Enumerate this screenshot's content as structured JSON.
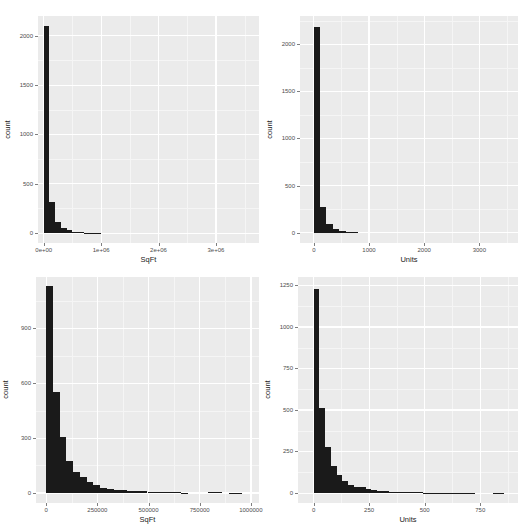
{
  "chart_data": [
    {
      "type": "bar",
      "title": "",
      "xlabel": "SqFt",
      "ylabel": "count",
      "x_ticks": [
        "0e+00",
        "1e+06",
        "2e+06",
        "3e+06"
      ],
      "x_tick_values": [
        0,
        1000000,
        2000000,
        3000000
      ],
      "y_ticks": [
        "0",
        "500",
        "1000",
        "1500",
        "2000"
      ],
      "y_tick_values": [
        0,
        500,
        1000,
        1500,
        2000
      ],
      "xlim": [
        -100000,
        3750000
      ],
      "ylim": [
        -100,
        2200
      ],
      "bin_width": 100000,
      "bin_starts": [
        0,
        100000,
        200000,
        300000,
        400000,
        500000,
        600000,
        700000,
        800000,
        900000
      ],
      "values": [
        2100,
        320,
        110,
        55,
        30,
        15,
        8,
        5,
        3,
        2
      ],
      "grid": true
    },
    {
      "type": "bar",
      "title": "",
      "xlabel": "Units",
      "ylabel": "count",
      "x_ticks": [
        "0",
        "1000",
        "2000",
        "3000"
      ],
      "x_tick_values": [
        0,
        1000,
        2000,
        3000
      ],
      "y_ticks": [
        "0",
        "500",
        "1000",
        "1500",
        "2000"
      ],
      "y_tick_values": [
        0,
        500,
        1000,
        1500,
        2000
      ],
      "xlim": [
        -250,
        3700
      ],
      "ylim": [
        -110,
        2300
      ],
      "bin_width": 115,
      "bin_starts": [
        0,
        115,
        230,
        345,
        460,
        575,
        690
      ],
      "values": [
        2180,
        270,
        90,
        40,
        20,
        10,
        4
      ],
      "grid": true
    },
    {
      "type": "bar",
      "title": "",
      "xlabel": "SqFt",
      "ylabel": "count",
      "x_ticks": [
        "0",
        "250000",
        "500000",
        "750000",
        "1000000"
      ],
      "x_tick_values": [
        0,
        250000,
        500000,
        750000,
        1000000
      ],
      "y_ticks": [
        "0",
        "300",
        "600",
        "900"
      ],
      "y_tick_values": [
        0,
        300,
        600,
        900
      ],
      "xlim": [
        -50000,
        1040000
      ],
      "ylim": [
        -55,
        1180
      ],
      "bin_width": 33000,
      "bin_starts": [
        0,
        33000,
        66000,
        99000,
        132000,
        165000,
        198000,
        231000,
        264000,
        297000,
        330000,
        363000,
        396000,
        429000,
        462000,
        495000,
        528000,
        561000,
        594000,
        627000,
        660000,
        693000,
        726000,
        759000,
        792000,
        825000,
        858000,
        891000,
        924000,
        957000
      ],
      "values": [
        1130,
        550,
        305,
        175,
        115,
        85,
        60,
        42,
        28,
        22,
        18,
        14,
        10,
        12,
        8,
        6,
        5,
        4,
        4,
        3,
        2,
        0,
        0,
        0,
        6,
        6,
        0,
        2,
        2,
        0
      ],
      "grid": true
    },
    {
      "type": "bar",
      "title": "",
      "xlabel": "Units",
      "ylabel": "count",
      "x_ticks": [
        "0",
        "250",
        "500",
        "750"
      ],
      "x_tick_values": [
        0,
        250,
        500,
        750
      ],
      "y_ticks": [
        "0",
        "250",
        "500",
        "750",
        "1000",
        "1250"
      ],
      "y_tick_values": [
        0,
        250,
        500,
        750,
        1000,
        1250
      ],
      "xlim": [
        -70,
        920
      ],
      "ylim": [
        -60,
        1300
      ],
      "bin_width": 26,
      "bin_starts": [
        0,
        26,
        52,
        78,
        104,
        130,
        156,
        182,
        208,
        234,
        260,
        286,
        312,
        338,
        364,
        390,
        416,
        442,
        468,
        494,
        520,
        546,
        572,
        598,
        624,
        650,
        676,
        702,
        728,
        754,
        780,
        806,
        832
      ],
      "values": [
        1230,
        510,
        280,
        160,
        110,
        75,
        50,
        38,
        35,
        25,
        18,
        14,
        12,
        8,
        6,
        5,
        8,
        5,
        4,
        3,
        3,
        2,
        2,
        1,
        1,
        1,
        1,
        1,
        0,
        0,
        0,
        1,
        1
      ],
      "grid": true
    }
  ],
  "panels": [
    {
      "xlabel": "SqFt",
      "ylabel": "count"
    },
    {
      "xlabel": "Units",
      "ylabel": "count"
    },
    {
      "xlabel": "SqFt",
      "ylabel": "count"
    },
    {
      "xlabel": "Units",
      "ylabel": "count"
    }
  ],
  "colors": {
    "panel_bg": "#ebebeb",
    "grid": "#ffffff",
    "bar_fill": "#1a1a1a"
  }
}
